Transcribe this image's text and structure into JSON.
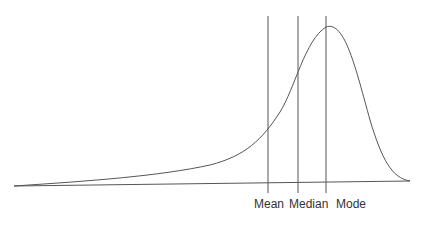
{
  "diagram": {
    "title": "",
    "type": "left-skewed distribution",
    "markers": [
      {
        "label": "Mean",
        "x": 268
      },
      {
        "label": "Median",
        "x": 298
      },
      {
        "label": "Mode",
        "x": 326
      }
    ],
    "colors": {
      "line": "#555555",
      "text": "#333333"
    }
  }
}
